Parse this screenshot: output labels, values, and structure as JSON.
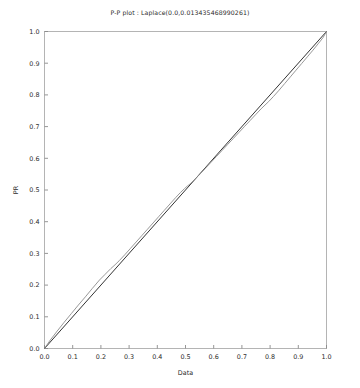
{
  "chart_data": {
    "type": "line",
    "title": "P-P plot : Laplace(0.0,0.013435468990261)",
    "xlabel": "Data",
    "ylabel": "PR",
    "xlim": [
      0.0,
      1.0
    ],
    "ylim": [
      0.0,
      1.0
    ],
    "grid": false,
    "legend": "none",
    "xticks": [
      "0.0",
      "0.1",
      "0.2",
      "0.3",
      "0.4",
      "0.5",
      "0.6",
      "0.7",
      "0.8",
      "0.9",
      "1.0"
    ],
    "yticks": [
      "0.0",
      "0.1",
      "0.2",
      "0.3",
      "0.4",
      "0.5",
      "0.6",
      "0.7",
      "0.8",
      "0.9",
      "1.0"
    ],
    "xtick_values": [
      0.0,
      0.1,
      0.2,
      0.3,
      0.4,
      0.5,
      0.6,
      0.7,
      0.8,
      0.9,
      1.0
    ],
    "ytick_values": [
      0.0,
      0.1,
      0.2,
      0.3,
      0.4,
      0.5,
      0.6,
      0.7,
      0.8,
      0.9,
      1.0
    ],
    "series": [
      {
        "name": "reference-line",
        "color": "#1c1c1c",
        "width": 0.9,
        "x": [
          0.0,
          1.0
        ],
        "values": [
          0.0,
          1.0
        ]
      },
      {
        "name": "pp-curve",
        "color": "#8c8c8c",
        "width": 0.9,
        "x": [
          0.0,
          0.02,
          0.045,
          0.07,
          0.095,
          0.12,
          0.145,
          0.17,
          0.195,
          0.215,
          0.235,
          0.25,
          0.265,
          0.285,
          0.305,
          0.325,
          0.345,
          0.365,
          0.385,
          0.405,
          0.425,
          0.445,
          0.465,
          0.482,
          0.496,
          0.506,
          0.516,
          0.53,
          0.55,
          0.57,
          0.59,
          0.61,
          0.63,
          0.65,
          0.67,
          0.69,
          0.71,
          0.73,
          0.75,
          0.768,
          0.782,
          0.795,
          0.812,
          0.832,
          0.852,
          0.872,
          0.892,
          0.912,
          0.932,
          0.952,
          0.972,
          0.988,
          1.0
        ],
        "values": [
          0.0,
          0.026,
          0.055,
          0.083,
          0.11,
          0.137,
          0.163,
          0.19,
          0.216,
          0.234,
          0.252,
          0.264,
          0.277,
          0.296,
          0.316,
          0.336,
          0.356,
          0.376,
          0.396,
          0.416,
          0.436,
          0.456,
          0.476,
          0.492,
          0.504,
          0.512,
          0.519,
          0.531,
          0.549,
          0.568,
          0.587,
          0.606,
          0.625,
          0.644,
          0.663,
          0.682,
          0.701,
          0.72,
          0.739,
          0.756,
          0.768,
          0.779,
          0.795,
          0.815,
          0.836,
          0.857,
          0.878,
          0.899,
          0.92,
          0.941,
          0.963,
          0.981,
          1.0
        ]
      }
    ]
  },
  "figure": {
    "background_color": "#ffffff",
    "frame_color": "#b4b4b4",
    "tick_color": "#8a8a8a",
    "text_color": "#2b2b2b"
  }
}
